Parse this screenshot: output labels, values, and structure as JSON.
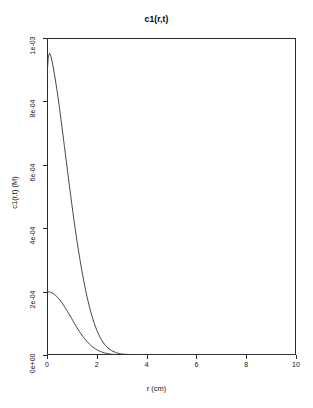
{
  "chart_data": {
    "type": "line",
    "title": "c1(r,t)",
    "xlabel": "r (cm)",
    "ylabel": "c1(r,t) (M)",
    "xlim": [
      0,
      10
    ],
    "ylim": [
      0,
      0.001
    ],
    "grid": false,
    "legend": "none",
    "xticks": [
      0,
      2,
      4,
      6,
      8,
      10
    ],
    "xticklabels": [
      "0",
      "2",
      "4",
      "6",
      "8",
      "10"
    ],
    "yticks": [
      0,
      0.0002,
      0.0004,
      0.0006,
      0.0008,
      0.001
    ],
    "yticklabels": [
      "0e+00",
      "2e-04",
      "4e-04",
      "6e-04",
      "8e-04",
      "1e-03"
    ],
    "line_color": "#333333",
    "series": [
      {
        "name": "curve-early",
        "x": [
          0.0,
          0.05,
          0.1,
          0.15,
          0.2,
          0.3,
          0.4,
          0.5,
          0.6,
          0.7,
          0.8,
          0.9,
          1.0,
          1.1,
          1.2,
          1.3,
          1.4,
          1.5,
          1.6,
          1.7,
          1.8,
          1.9,
          2.0,
          2.1,
          2.2,
          2.3,
          2.4,
          2.5,
          2.6,
          2.8,
          3.0,
          3.5,
          4.0,
          5.0,
          6.0,
          8.0,
          10.0
        ],
        "y": [
          0.00088,
          0.00094,
          0.000952,
          0.000944,
          0.000928,
          0.000886,
          0.000836,
          0.00078,
          0.00072,
          0.000658,
          0.000596,
          0.000534,
          0.000474,
          0.000416,
          0.000362,
          0.000312,
          0.000266,
          0.000224,
          0.000186,
          0.000153,
          0.000124,
          9.9e-05,
          7.8e-05,
          6.05e-05,
          4.62e-05,
          3.48e-05,
          2.58e-05,
          1.88e-05,
          1.35e-05,
          6.6e-06,
          3.1e-06,
          5e-07,
          8e-08,
          0.0,
          0.0,
          0.0,
          0.0
        ]
      },
      {
        "name": "curve-late",
        "x": [
          0.0,
          0.1,
          0.2,
          0.3,
          0.4,
          0.5,
          0.6,
          0.7,
          0.8,
          0.9,
          1.0,
          1.1,
          1.2,
          1.3,
          1.4,
          1.5,
          1.6,
          1.7,
          1.8,
          1.9,
          2.0,
          2.1,
          2.2,
          2.3,
          2.4,
          2.5,
          2.6,
          2.8,
          3.0,
          3.5,
          4.0,
          5.0,
          6.0,
          8.0,
          10.0
        ],
        "y": [
          0.0002,
          0.000199,
          0.000196,
          0.000191,
          0.000184,
          0.000175,
          0.000165,
          0.000153,
          0.00014,
          0.000127,
          0.000114,
          0.0001,
          8.7e-05,
          7.45e-05,
          6.3e-05,
          5.24e-05,
          4.3e-05,
          3.47e-05,
          2.76e-05,
          2.16e-05,
          1.66e-05,
          1.26e-05,
          9.3e-06,
          6.8e-06,
          4.85e-06,
          3.4e-06,
          2.34e-06,
          1.04e-06,
          4.3e-07,
          4e-08,
          0.0,
          0.0,
          0.0,
          0.0,
          0.0
        ]
      },
      {
        "name": "curve-baseline",
        "x": [
          0.0,
          10.0
        ],
        "y": [
          0.0,
          0.0
        ]
      }
    ]
  }
}
